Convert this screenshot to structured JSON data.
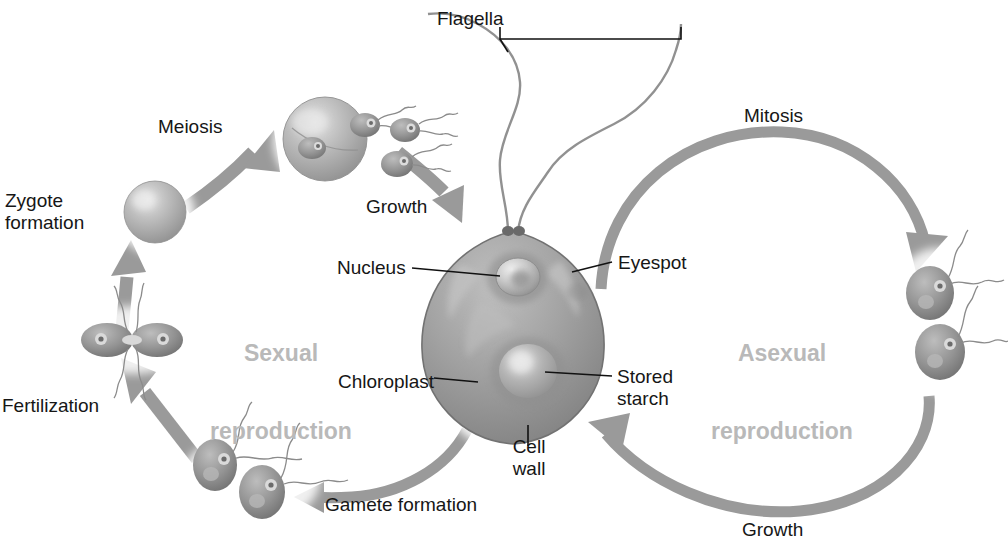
{
  "diagram": {
    "colors": {
      "arrow": "#9a9a9a",
      "arrow_dark": "#8a8a8a",
      "cycle_text": "#b9b9b9",
      "label_text": "#161616",
      "cell_fill": "#9b9b9b",
      "cell_edge": "#6f6f6f",
      "background": "#ffffff"
    },
    "cycle_labels": [
      {
        "id": "sexual",
        "lines": [
          "Sexual",
          "reproduction"
        ],
        "x": 196,
        "y": 288,
        "w": 170
      },
      {
        "id": "asexual",
        "lines": [
          "Asexual",
          "reproduction"
        ],
        "x": 692,
        "y": 288,
        "w": 180
      }
    ],
    "stage_labels": [
      {
        "id": "flagella",
        "text": "Flagella",
        "x": 437,
        "y": 8
      },
      {
        "id": "meiosis",
        "text": "Meiosis",
        "x": 158,
        "y": 116
      },
      {
        "id": "mitosis",
        "text": "Mitosis",
        "x": 744,
        "y": 105
      },
      {
        "id": "growth-top",
        "text": "Growth",
        "x": 366,
        "y": 196
      },
      {
        "id": "zygote-formation",
        "text": "Zygote\nformation",
        "x": 5,
        "y": 190
      },
      {
        "id": "nucleus",
        "text": "Nucleus",
        "x": 337,
        "y": 257
      },
      {
        "id": "eyespot",
        "text": "Eyespot",
        "x": 618,
        "y": 252
      },
      {
        "id": "chloroplast",
        "text": "Chloroplast",
        "x": 338,
        "y": 371
      },
      {
        "id": "stored-starch",
        "text": "Stored\nstarch",
        "x": 617,
        "y": 366
      },
      {
        "id": "cell-wall",
        "text": "Cell\nwall",
        "x": 505,
        "y": 436
      },
      {
        "id": "fertilization",
        "text": "Fertilization",
        "x": 2,
        "y": 395
      },
      {
        "id": "gamete-formation",
        "text": "Gamete formation",
        "x": 325,
        "y": 494
      },
      {
        "id": "growth-bottom",
        "text": "Growth",
        "x": 742,
        "y": 519
      }
    ],
    "structures": [
      {
        "id": "main-cell",
        "name": "vegetative-cell"
      },
      {
        "id": "zygote",
        "name": "zygote-sphere"
      },
      {
        "id": "meiotic-sphere",
        "name": "meiosis-sphere-releasing-cells"
      },
      {
        "id": "fusing-gametes",
        "name": "fusing-gamete-pair"
      },
      {
        "id": "gamete-pair",
        "name": "gamete-pair"
      },
      {
        "id": "mitotic-pair",
        "name": "daughter-cell-pair"
      }
    ],
    "arrows": [
      {
        "id": "meiosis-arrow",
        "label": "Meiosis",
        "direction": "up-right"
      },
      {
        "id": "growth-arrow",
        "label": "Growth",
        "direction": "down-right"
      },
      {
        "id": "mitosis-arc",
        "label": "Mitosis",
        "direction": "clockwise-right"
      },
      {
        "id": "growth-arc",
        "label": "Growth",
        "direction": "counter-clockwise-bottom-right"
      },
      {
        "id": "gamete-arc",
        "label": "Gamete formation",
        "direction": "leftward-bottom"
      },
      {
        "id": "fertilization-arrow",
        "label": "Fertilization",
        "direction": "up-left"
      },
      {
        "id": "zygote-arrow",
        "label": "Zygote formation",
        "direction": "up"
      }
    ]
  }
}
